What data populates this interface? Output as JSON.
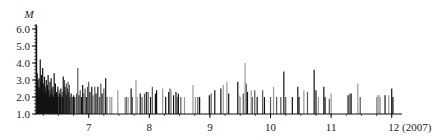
{
  "chart_data": {
    "type": "bar",
    "subtype": "spike-time-series",
    "title": "",
    "xlabel": "(2007)",
    "ylabel": "M",
    "xlim": [
      6.13,
      12.15
    ],
    "ylim": [
      1.0,
      6.3
    ],
    "x_ticks": [
      7,
      8,
      9,
      10,
      11,
      12
    ],
    "x_tick_labels": [
      "7",
      "8",
      "9",
      "10",
      "11",
      "12 (2007)"
    ],
    "y_ticks": [
      1.0,
      2.0,
      3.0,
      4.0,
      5.0,
      6.0
    ],
    "y_tick_labels": [
      "1.0",
      "2.0",
      "3.0",
      "4.0",
      "5.0",
      "6.0"
    ],
    "grid": false,
    "legend": null,
    "colors": {
      "dark": "#111111",
      "mid": "#555555",
      "light": "#999999"
    },
    "events": [
      [
        6.14,
        6.2,
        "dark"
      ],
      [
        6.15,
        3.4,
        "dark"
      ],
      [
        6.16,
        3.0,
        "dark"
      ],
      [
        6.17,
        2.6,
        "dark"
      ],
      [
        6.18,
        3.1,
        "dark"
      ],
      [
        6.19,
        2.5,
        "dark"
      ],
      [
        6.2,
        4.2,
        "dark"
      ],
      [
        6.21,
        2.9,
        "dark"
      ],
      [
        6.22,
        3.3,
        "dark"
      ],
      [
        6.23,
        2.4,
        "dark"
      ],
      [
        6.24,
        3.7,
        "dark"
      ],
      [
        6.25,
        2.8,
        "dark"
      ],
      [
        6.26,
        2.2,
        "dark"
      ],
      [
        6.27,
        3.2,
        "dark"
      ],
      [
        6.28,
        2.6,
        "dark"
      ],
      [
        6.29,
        2.3,
        "dark"
      ],
      [
        6.3,
        3.0,
        "dark"
      ],
      [
        6.31,
        2.1,
        "dark"
      ],
      [
        6.32,
        2.7,
        "dark"
      ],
      [
        6.33,
        3.3,
        "dark"
      ],
      [
        6.34,
        2.4,
        "dark"
      ],
      [
        6.35,
        2.0,
        "dark"
      ],
      [
        6.36,
        2.9,
        "dark"
      ],
      [
        6.37,
        2.2,
        "dark"
      ],
      [
        6.38,
        3.1,
        "dark"
      ],
      [
        6.39,
        2.5,
        "dark"
      ],
      [
        6.4,
        2.1,
        "dark"
      ],
      [
        6.41,
        2.6,
        "dark"
      ],
      [
        6.42,
        2.0,
        "dark"
      ],
      [
        6.43,
        3.4,
        "dark"
      ],
      [
        6.44,
        2.2,
        "dark"
      ],
      [
        6.45,
        2.8,
        "dark"
      ],
      [
        6.46,
        2.0,
        "dark"
      ],
      [
        6.47,
        2.3,
        "dark"
      ],
      [
        6.48,
        2.1,
        "dark"
      ],
      [
        6.49,
        2.6,
        "dark"
      ],
      [
        6.5,
        2.0,
        "dark"
      ],
      [
        6.51,
        2.4,
        "mid"
      ],
      [
        6.52,
        2.2,
        "dark"
      ],
      [
        6.53,
        2.0,
        "dark"
      ],
      [
        6.54,
        2.5,
        "dark"
      ],
      [
        6.55,
        2.1,
        "dark"
      ],
      [
        6.56,
        2.3,
        "mid"
      ],
      [
        6.57,
        2.0,
        "dark"
      ],
      [
        6.58,
        3.2,
        "dark"
      ],
      [
        6.59,
        2.4,
        "dark"
      ],
      [
        6.6,
        3.0,
        "mid"
      ],
      [
        6.61,
        2.6,
        "dark"
      ],
      [
        6.62,
        2.2,
        "dark"
      ],
      [
        6.63,
        2.8,
        "mid"
      ],
      [
        6.64,
        2.1,
        "dark"
      ],
      [
        6.65,
        2.5,
        "dark"
      ],
      [
        6.66,
        2.9,
        "mid"
      ],
      [
        6.67,
        2.3,
        "dark"
      ],
      [
        6.68,
        2.7,
        "mid"
      ],
      [
        6.69,
        2.0,
        "dark"
      ],
      [
        6.71,
        2.2,
        "dark"
      ],
      [
        6.73,
        2.0,
        "mid"
      ],
      [
        6.75,
        2.1,
        "dark"
      ],
      [
        6.77,
        2.0,
        "dark"
      ],
      [
        6.8,
        2.2,
        "mid"
      ],
      [
        6.82,
        3.7,
        "mid"
      ],
      [
        6.84,
        2.1,
        "dark"
      ],
      [
        6.86,
        2.4,
        "mid"
      ],
      [
        6.88,
        2.0,
        "dark"
      ],
      [
        6.9,
        2.7,
        "dark"
      ],
      [
        6.92,
        2.2,
        "mid"
      ],
      [
        6.94,
        2.5,
        "mid"
      ],
      [
        6.96,
        2.0,
        "dark"
      ],
      [
        6.98,
        2.6,
        "mid"
      ],
      [
        7.0,
        2.9,
        "mid"
      ],
      [
        7.02,
        2.3,
        "dark"
      ],
      [
        7.05,
        2.6,
        "dark"
      ],
      [
        7.07,
        2.1,
        "mid"
      ],
      [
        7.1,
        2.6,
        "mid"
      ],
      [
        7.12,
        2.2,
        "dark"
      ],
      [
        7.15,
        2.6,
        "dark"
      ],
      [
        7.18,
        2.0,
        "mid"
      ],
      [
        7.2,
        2.8,
        "mid"
      ],
      [
        7.22,
        2.2,
        "dark"
      ],
      [
        7.25,
        2.5,
        "mid"
      ],
      [
        7.28,
        3.1,
        "dark"
      ],
      [
        7.3,
        2.0,
        "mid"
      ],
      [
        7.35,
        2.0,
        "light"
      ],
      [
        7.38,
        2.0,
        "light"
      ],
      [
        7.48,
        2.4,
        "light"
      ],
      [
        7.6,
        2.0,
        "light"
      ],
      [
        7.62,
        2.0,
        "mid"
      ],
      [
        7.65,
        2.0,
        "light"
      ],
      [
        7.7,
        2.5,
        "dark"
      ],
      [
        7.72,
        2.0,
        "mid"
      ],
      [
        7.78,
        3.0,
        "light"
      ],
      [
        7.8,
        2.0,
        "light"
      ],
      [
        7.85,
        2.2,
        "dark"
      ],
      [
        7.88,
        2.0,
        "mid"
      ],
      [
        7.92,
        2.2,
        "mid"
      ],
      [
        7.95,
        2.3,
        "dark"
      ],
      [
        7.98,
        2.3,
        "mid"
      ],
      [
        8.02,
        2.0,
        "dark"
      ],
      [
        8.05,
        2.6,
        "mid"
      ],
      [
        8.1,
        2.2,
        "dark"
      ],
      [
        8.12,
        2.4,
        "dark"
      ],
      [
        8.22,
        2.5,
        "light"
      ],
      [
        8.27,
        2.0,
        "dark"
      ],
      [
        8.32,
        2.3,
        "dark"
      ],
      [
        8.34,
        2.5,
        "mid"
      ],
      [
        8.36,
        2.4,
        "light"
      ],
      [
        8.4,
        2.1,
        "dark"
      ],
      [
        8.44,
        2.3,
        "dark"
      ],
      [
        8.46,
        2.0,
        "mid"
      ],
      [
        8.48,
        2.2,
        "dark"
      ],
      [
        8.52,
        2.0,
        "mid"
      ],
      [
        8.58,
        2.0,
        "light"
      ],
      [
        8.72,
        2.7,
        "light"
      ],
      [
        8.76,
        2.0,
        "light"
      ],
      [
        8.8,
        2.0,
        "mid"
      ],
      [
        8.83,
        2.0,
        "dark"
      ],
      [
        8.99,
        2.1,
        "dark"
      ],
      [
        9.02,
        2.2,
        "mid"
      ],
      [
        9.08,
        2.4,
        "dark"
      ],
      [
        9.18,
        2.5,
        "dark"
      ],
      [
        9.22,
        2.7,
        "light"
      ],
      [
        9.28,
        2.9,
        "light"
      ],
      [
        9.31,
        2.2,
        "dark"
      ],
      [
        9.46,
        2.9,
        "dark"
      ],
      [
        9.48,
        2.1,
        "light"
      ],
      [
        9.5,
        2.0,
        "light"
      ],
      [
        9.55,
        2.2,
        "mid"
      ],
      [
        9.58,
        4.0,
        "light"
      ],
      [
        9.6,
        2.8,
        "mid"
      ],
      [
        9.62,
        2.3,
        "dark"
      ],
      [
        9.68,
        2.4,
        "light"
      ],
      [
        9.7,
        2.0,
        "mid"
      ],
      [
        9.74,
        2.4,
        "mid"
      ],
      [
        9.78,
        2.0,
        "dark"
      ],
      [
        9.87,
        2.4,
        "mid"
      ],
      [
        9.9,
        2.0,
        "dark"
      ],
      [
        10.0,
        2.0,
        "mid"
      ],
      [
        10.05,
        2.6,
        "light"
      ],
      [
        10.1,
        2.0,
        "mid"
      ],
      [
        10.17,
        2.0,
        "mid"
      ],
      [
        10.22,
        3.5,
        "dark"
      ],
      [
        10.25,
        2.0,
        "mid"
      ],
      [
        10.36,
        2.0,
        "dark"
      ],
      [
        10.45,
        2.6,
        "dark"
      ],
      [
        10.47,
        2.0,
        "dark"
      ],
      [
        10.55,
        2.4,
        "light"
      ],
      [
        10.61,
        2.3,
        "mid"
      ],
      [
        10.72,
        3.6,
        "dark"
      ],
      [
        10.75,
        2.4,
        "dark"
      ],
      [
        10.79,
        2.0,
        "light"
      ],
      [
        10.88,
        2.6,
        "dark"
      ],
      [
        10.9,
        2.0,
        "dark"
      ],
      [
        10.97,
        1.9,
        "mid"
      ],
      [
        11.0,
        2.2,
        "light"
      ],
      [
        11.28,
        2.1,
        "dark"
      ],
      [
        11.31,
        2.2,
        "mid"
      ],
      [
        11.33,
        2.2,
        "dark"
      ],
      [
        11.44,
        2.8,
        "light"
      ],
      [
        11.48,
        2.0,
        "mid"
      ],
      [
        11.75,
        2.0,
        "light"
      ],
      [
        11.77,
        2.1,
        "light"
      ],
      [
        11.79,
        2.1,
        "light"
      ],
      [
        11.81,
        2.0,
        "light"
      ],
      [
        11.89,
        2.1,
        "dark"
      ],
      [
        11.95,
        2.1,
        "light"
      ],
      [
        12.0,
        2.5,
        "dark"
      ],
      [
        12.02,
        2.0,
        "dark"
      ]
    ]
  }
}
